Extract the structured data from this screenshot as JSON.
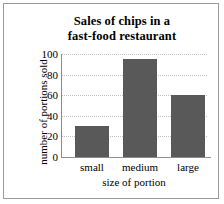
{
  "chart_data": {
    "type": "bar",
    "title": "Sales of chips in a fast-food restaurant",
    "title_line1": "Sales of chips in a",
    "title_line2": "fast-food restaurant",
    "categories": [
      "small",
      "medium",
      "large"
    ],
    "values": [
      30,
      95,
      60
    ],
    "xlabel": "size of portion",
    "ylabel": "number of portions sold",
    "ylim": [
      0,
      100
    ],
    "yticks": [
      100,
      80,
      60,
      40,
      20,
      0
    ],
    "grid": true,
    "legend": "none",
    "bar_color": "#595959",
    "grid_color": "#c0c0c0",
    "axis_color": "#8c8c8c",
    "frame_color": "#9a9a9a"
  }
}
